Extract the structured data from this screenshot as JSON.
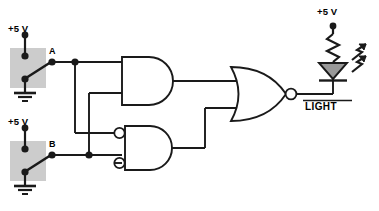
{
  "diagram": {
    "colors": {
      "wire": "#1a1a1a",
      "switch_box_fill": "#cccccc",
      "led_fill": "#999999",
      "background": "#ffffff"
    },
    "labels": {
      "supply_a": "+5 V",
      "supply_b": "+5 V",
      "supply_led": "+5 V",
      "node_a": "A",
      "node_b": "B",
      "output": "LIGHT"
    },
    "components": [
      {
        "name": "switch-a",
        "type": "spdt-switch",
        "label": "A",
        "supply": "+5 V"
      },
      {
        "name": "switch-b",
        "type": "spdt-switch",
        "label": "B",
        "supply": "+5 V"
      },
      {
        "name": "gate-and",
        "type": "and-gate",
        "inputs": 2,
        "inverted_inputs": false,
        "inverted_output": false
      },
      {
        "name": "gate-and-inverted-inputs",
        "type": "and-gate",
        "inputs": 2,
        "inverted_inputs": true,
        "inverted_output": false
      },
      {
        "name": "gate-nor",
        "type": "or-gate",
        "inputs": 2,
        "inverted_inputs": false,
        "inverted_output": true
      },
      {
        "name": "resistor",
        "type": "resistor",
        "supply": "+5 V"
      },
      {
        "name": "led",
        "type": "light-emitting-diode",
        "label": "LIGHT"
      }
    ]
  }
}
